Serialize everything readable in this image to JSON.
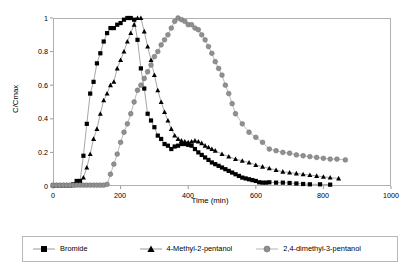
{
  "chart_data": {
    "type": "line",
    "title": "",
    "xlabel": "Time (min)",
    "ylabel": "C/Cmax",
    "xlim": [
      0,
      1000
    ],
    "ylim": [
      0,
      1
    ],
    "xticks": [
      0,
      200,
      400,
      600,
      800,
      1000
    ],
    "yticks": [
      0,
      0.2,
      0.4,
      0.6,
      0.8,
      1
    ],
    "xtick_labels": [
      "0",
      "200",
      "400",
      "600",
      "800",
      "1000"
    ],
    "ytick_labels": [
      "0",
      "0.2",
      "0.4",
      "0.6",
      "0.8",
      "1"
    ],
    "grid": false,
    "legend_position": "below",
    "series": [
      {
        "name": "Bromide",
        "marker": "square",
        "color": "#000000",
        "line_color": "#909090",
        "x": [
          0,
          10,
          20,
          30,
          40,
          50,
          60,
          70,
          80,
          90,
          100,
          110,
          120,
          130,
          140,
          150,
          160,
          170,
          180,
          190,
          200,
          210,
          220,
          230,
          240,
          250,
          260,
          270,
          280,
          290,
          300,
          310,
          320,
          330,
          340,
          350,
          360,
          370,
          380,
          390,
          400,
          410,
          420,
          430,
          440,
          450,
          460,
          470,
          480,
          490,
          500,
          510,
          520,
          530,
          540,
          550,
          560,
          570,
          580,
          590,
          600,
          610,
          620,
          630,
          640,
          660,
          680,
          700,
          720,
          740,
          760,
          790,
          820
        ],
        "y": [
          0.005,
          0.005,
          0.005,
          0.005,
          0.005,
          0.005,
          0.01,
          0.03,
          0.03,
          0.18,
          0.37,
          0.55,
          0.62,
          0.73,
          0.79,
          0.86,
          0.91,
          0.94,
          0.94,
          0.96,
          0.97,
          0.99,
          1.0,
          1.0,
          0.99,
          0.87,
          0.7,
          0.58,
          0.43,
          0.39,
          0.35,
          0.3,
          0.28,
          0.25,
          0.24,
          0.22,
          0.235,
          0.24,
          0.25,
          0.25,
          0.245,
          0.24,
          0.22,
          0.2,
          0.185,
          0.17,
          0.155,
          0.14,
          0.13,
          0.12,
          0.11,
          0.1,
          0.09,
          0.08,
          0.07,
          0.06,
          0.05,
          0.045,
          0.04,
          0.035,
          0.03,
          0.022,
          0.02,
          0.02,
          0.022,
          0.02,
          0.02,
          0.018,
          0.015,
          0.012,
          0.01,
          0.01,
          0.008
        ]
      },
      {
        "name": "4-Methyl-2-pentanol",
        "marker": "triangle",
        "color": "#000000",
        "line_color": "#909090",
        "x": [
          0,
          10,
          20,
          30,
          40,
          50,
          60,
          70,
          80,
          90,
          100,
          110,
          120,
          130,
          140,
          150,
          160,
          170,
          180,
          190,
          200,
          210,
          220,
          230,
          240,
          250,
          260,
          270,
          280,
          290,
          300,
          310,
          320,
          330,
          340,
          350,
          360,
          370,
          380,
          390,
          400,
          410,
          420,
          430,
          440,
          450,
          460,
          470,
          480,
          500,
          520,
          540,
          560,
          580,
          600,
          620,
          640,
          660,
          680,
          700,
          720,
          740,
          760,
          780,
          800,
          820,
          845
        ],
        "y": [
          0.005,
          0.005,
          0.005,
          0.005,
          0.005,
          0.005,
          0.005,
          0.01,
          0.02,
          0.05,
          0.11,
          0.19,
          0.28,
          0.34,
          0.43,
          0.51,
          0.55,
          0.6,
          0.62,
          0.7,
          0.75,
          0.8,
          0.86,
          0.91,
          0.96,
          1.0,
          1.0,
          0.92,
          0.83,
          0.75,
          0.66,
          0.57,
          0.5,
          0.44,
          0.39,
          0.34,
          0.3,
          0.28,
          0.27,
          0.265,
          0.26,
          0.265,
          0.27,
          0.265,
          0.255,
          0.24,
          0.23,
          0.22,
          0.21,
          0.19,
          0.175,
          0.16,
          0.15,
          0.14,
          0.125,
          0.115,
          0.105,
          0.095,
          0.085,
          0.08,
          0.075,
          0.07,
          0.065,
          0.06,
          0.055,
          0.05,
          0.045
        ]
      },
      {
        "name": "2,4-dimethyl-3-pentanol",
        "marker": "circle",
        "color": "#909090",
        "line_color": "#aaaaaa",
        "x": [
          0,
          10,
          20,
          30,
          40,
          50,
          60,
          70,
          80,
          90,
          100,
          110,
          120,
          130,
          140,
          150,
          160,
          170,
          180,
          190,
          200,
          210,
          220,
          230,
          240,
          250,
          260,
          270,
          280,
          290,
          300,
          310,
          320,
          330,
          340,
          350,
          360,
          370,
          380,
          390,
          400,
          410,
          420,
          430,
          440,
          450,
          460,
          470,
          480,
          490,
          500,
          510,
          520,
          530,
          540,
          560,
          580,
          600,
          620,
          640,
          660,
          680,
          700,
          720,
          740,
          760,
          780,
          800,
          820,
          840,
          865
        ],
        "y": [
          0.005,
          0.005,
          0.005,
          0.005,
          0.005,
          0.005,
          0.005,
          0.005,
          0.005,
          0.005,
          0.005,
          0.005,
          0.005,
          0.005,
          0.005,
          0.005,
          0.01,
          0.07,
          0.13,
          0.19,
          0.26,
          0.32,
          0.37,
          0.43,
          0.5,
          0.57,
          0.6,
          0.64,
          0.68,
          0.72,
          0.77,
          0.8,
          0.84,
          0.87,
          0.9,
          0.94,
          0.98,
          1.0,
          0.99,
          0.98,
          0.96,
          0.96,
          0.94,
          0.93,
          0.9,
          0.87,
          0.83,
          0.79,
          0.74,
          0.7,
          0.66,
          0.6,
          0.55,
          0.49,
          0.43,
          0.37,
          0.32,
          0.29,
          0.26,
          0.22,
          0.21,
          0.2,
          0.195,
          0.185,
          0.18,
          0.175,
          0.17,
          0.165,
          0.16,
          0.16,
          0.155
        ]
      }
    ]
  },
  "axes": {
    "ylabel": "C/Cmax",
    "xlabel": "Time (min)"
  },
  "legend": {
    "items": [
      {
        "label": "Bromide",
        "marker": "square",
        "color": "#000000"
      },
      {
        "label": "4-Methyl-2-pentanol",
        "marker": "triangle",
        "color": "#000000"
      },
      {
        "label": "2,4-dimethyl-3-pentanol",
        "marker": "circle",
        "color": "#909090"
      }
    ]
  },
  "colors": {
    "frame": "#b0b0b0",
    "line": "#9a9a9a",
    "dark_marker": "#000000",
    "gray_marker": "#8f8f8f",
    "background": "#ffffff"
  }
}
